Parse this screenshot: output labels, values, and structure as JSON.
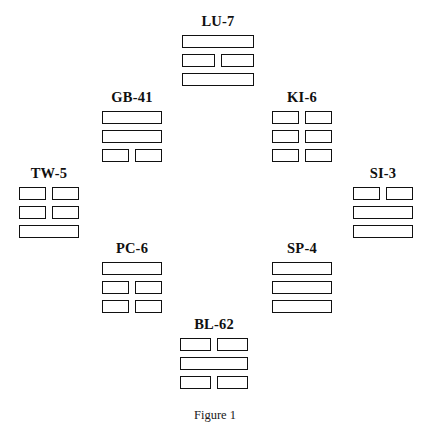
{
  "figure": {
    "caption": "Figure 1",
    "caption_top": 408,
    "background_color": "#ffffff",
    "line_color": "#111111",
    "text_color": "#101010"
  },
  "trigrams": [
    {
      "id": "lu-7",
      "label": "LU-7",
      "position": "top",
      "left": 182,
      "top": 14,
      "width": 72,
      "lines": [
        "yang",
        "yin",
        "yang"
      ]
    },
    {
      "id": "gb-41",
      "label": "GB-41",
      "position": "upper-left",
      "left": 102,
      "top": 90,
      "width": 60,
      "lines": [
        "yang",
        "yang",
        "yin"
      ]
    },
    {
      "id": "ki-6",
      "label": "KI-6",
      "position": "upper-right",
      "left": 272,
      "top": 90,
      "width": 60,
      "lines": [
        "yin",
        "yin",
        "yin"
      ]
    },
    {
      "id": "tw-5",
      "label": "TW-5",
      "position": "left",
      "left": 19,
      "top": 166,
      "width": 60,
      "lines": [
        "yin",
        "yin",
        "yang"
      ]
    },
    {
      "id": "si-3",
      "label": "SI-3",
      "position": "right",
      "left": 353,
      "top": 166,
      "width": 60,
      "lines": [
        "yin",
        "yang",
        "yang"
      ]
    },
    {
      "id": "pc-6",
      "label": "PC-6",
      "position": "lower-left",
      "left": 102,
      "top": 241,
      "width": 60,
      "lines": [
        "yang",
        "yin",
        "yin"
      ]
    },
    {
      "id": "sp-4",
      "label": "SP-4",
      "position": "lower-right",
      "left": 272,
      "top": 241,
      "width": 60,
      "lines": [
        "yang",
        "yang",
        "yang"
      ]
    },
    {
      "id": "bl-62",
      "label": "BL-62",
      "position": "bottom",
      "left": 180,
      "top": 317,
      "width": 68,
      "lines": [
        "yin",
        "yang",
        "yin"
      ]
    }
  ]
}
